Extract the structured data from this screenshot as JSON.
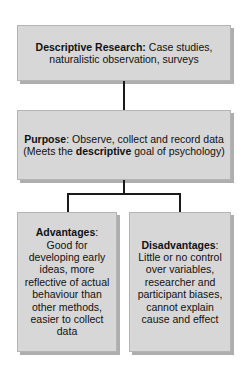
{
  "diagram": {
    "title": "Descriptive Research",
    "background_color": "#ffffff",
    "box_fill_color": "#d7d7d7",
    "box_border_color": "#b4b4b4",
    "connector_color": "#1a1a1a"
  },
  "nodes": {
    "descriptive": {
      "heading": "Descriptive Research:",
      "body": "Case studies, naturalistic observation, surveys"
    },
    "purpose": {
      "heading": "Purpose",
      "heading_suffix": ":",
      "body_before": "Observe, collect and record data (Meets the ",
      "body_emphasis": "descriptive",
      "body_after": " goal of psychology)"
    },
    "advantages": {
      "heading": "Advantages",
      "heading_suffix": ":",
      "body": "Good for developing early ideas, more reflective of actual behaviour than other methods, easier to collect data"
    },
    "disadvantages": {
      "heading": "Disadvantages",
      "heading_suffix": ":",
      "body": "Little or no control over variables, researcher and participant biases, cannot explain cause and effect"
    }
  }
}
